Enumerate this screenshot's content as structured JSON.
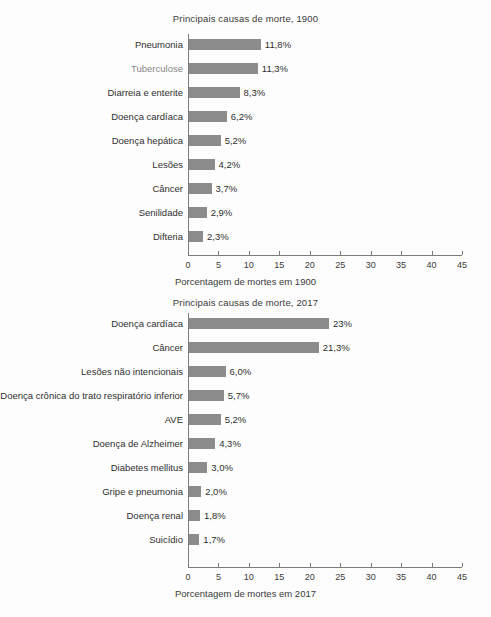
{
  "document": {
    "language": "pt-BR",
    "background_color": "#fdfdfd",
    "bar_color": "#8c8c8c",
    "axis_color": "#7c7c7c"
  },
  "chart_data": [
    {
      "type": "bar",
      "orientation": "horizontal",
      "title": "Principais causas de morte, 1900",
      "xlabel": "Porcentagem de mortes em 1900",
      "ylabel": "",
      "xlim": [
        0,
        45
      ],
      "xticks": [
        "0",
        "5",
        "10",
        "15",
        "20",
        "25",
        "30",
        "35",
        "40",
        "45"
      ],
      "grid": false,
      "legend": "none",
      "categories": [
        "Pneumonia",
        "Tuberculose",
        "Diarreia e enterite",
        "Doença cardíaca",
        "Doença hepática",
        "Lesões",
        "Câncer",
        "Senilidade",
        "Difteria"
      ],
      "values": [
        11.8,
        11.3,
        8.3,
        6.2,
        5.2,
        4.2,
        3.7,
        2.9,
        2.3
      ],
      "data_labels": [
        "11,8%",
        "11,3%",
        "8,3%",
        "6,2%",
        "5,2%",
        "4,2%",
        "3,7%",
        "2,9%",
        "2,3%"
      ]
    },
    {
      "type": "bar",
      "orientation": "horizontal",
      "title": "Principais causas de morte, 2017",
      "xlabel": "Porcentagem de mortes em 2017",
      "ylabel": "",
      "xlim": [
        0,
        45
      ],
      "xticks": [
        "0",
        "5",
        "10",
        "15",
        "20",
        "25",
        "30",
        "35",
        "40",
        "45"
      ],
      "grid": false,
      "legend": "none",
      "categories": [
        "Doença cardíaca",
        "Câncer",
        "Lesões não intencionais",
        "Doença crônica do trato respiratório inferior",
        "AVE",
        "Doença de Alzheimer",
        "Diabetes mellitus",
        "Gripe e pneumonia",
        "Doença renal",
        "Suicídio"
      ],
      "values": [
        23.0,
        21.3,
        6.0,
        5.7,
        5.2,
        4.3,
        3.0,
        2.0,
        1.8,
        1.7
      ],
      "data_labels": [
        "23%",
        "21,3%",
        "6,0%",
        "5,7%",
        "5,2%",
        "4,3%",
        "3,0%",
        "2,0%",
        "1,8%",
        "1,7%"
      ]
    }
  ]
}
